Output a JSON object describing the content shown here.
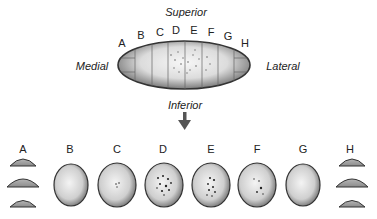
{
  "orientation": {
    "superior": "Superior",
    "inferior": "Inferior",
    "medial": "Medial",
    "lateral": "Lateral"
  },
  "top_section_labels": [
    "A",
    "B",
    "C",
    "D",
    "E",
    "F",
    "G",
    "H"
  ],
  "bottom_section_labels": [
    "A",
    "B",
    "C",
    "D",
    "E",
    "F",
    "G",
    "H"
  ],
  "colors": {
    "outline": "#333333",
    "fill_light": "#f2f2f2",
    "fill_dark": "#8a8a8a",
    "arrow": "#555555"
  }
}
